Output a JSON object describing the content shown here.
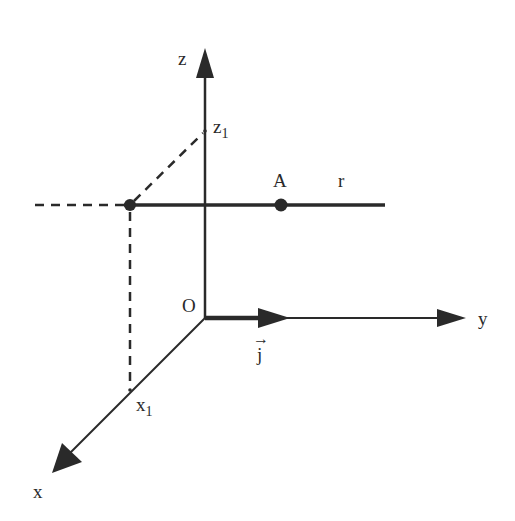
{
  "diagram": {
    "type": "3d-coordinate-axes",
    "colors": {
      "ink": "#2a2a2a",
      "background": "#ffffff"
    },
    "axes": {
      "z": {
        "label": "z",
        "tick": {
          "label": "z",
          "subscript": "1"
        }
      },
      "y": {
        "label": "y"
      },
      "x": {
        "label": "x",
        "tick": {
          "label": "x",
          "subscript": "1"
        }
      }
    },
    "origin": {
      "label": "O"
    },
    "vector": {
      "label": "j",
      "arrow": "→"
    },
    "line": {
      "label": "r"
    },
    "point": {
      "label": "A"
    }
  }
}
